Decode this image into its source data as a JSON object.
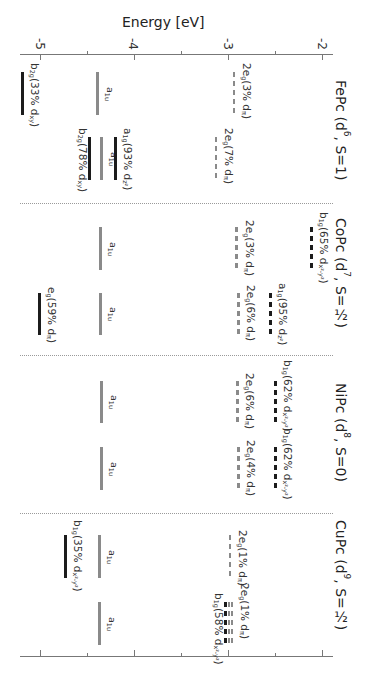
{
  "title": "Energy [eV]",
  "chart_data": {
    "type": "energy-level-diagram",
    "title": "Energy [eV]",
    "xlabel": "Energy [eV]",
    "ylabel": "",
    "orientation": "rotated 90° clockwise (energy increases to the right)",
    "axis": {
      "range": [
        -5.2,
        -1.9
      ],
      "major_ticks": [
        -5,
        -4,
        -3,
        -2
      ],
      "tick_labels": [
        "-5",
        "-4",
        "-3",
        "-2"
      ],
      "minor_ticks": [
        -4.5,
        -3.5,
        -2.5
      ]
    },
    "styles": {
      "black": "#1c1c1c",
      "gray": "#8a8a8a"
    },
    "compounds": [
      {
        "name": "FePc",
        "label": [
          {
            "t": "FePc (d"
          },
          {
            "t": "6",
            "sup": true
          },
          {
            "t": ", S=1)"
          }
        ],
        "label_y": 80,
        "columns": [
          {
            "y_range": [
              72,
              115
            ],
            "levels": [
              {
                "symmetry": "b2g",
                "d_character": "33% dxy",
                "energy": -5.19,
                "color": "black",
                "style": "solid",
                "side": "right",
                "label": [
                  {
                    "t": "b"
                  },
                  {
                    "t": "2g",
                    "sub": true
                  },
                  {
                    "t": "(33% d"
                  },
                  {
                    "t": "xy",
                    "sub": true
                  },
                  {
                    "t": ")"
                  }
                ]
              },
              {
                "symmetry": "a1u",
                "energy": -4.39,
                "color": "gray",
                "style": "solid",
                "side": "center",
                "label": [
                  {
                    "t": "a"
                  },
                  {
                    "t": "1u",
                    "sub": true
                  }
                ]
              },
              {
                "symmetry": "2eg",
                "d_character": "3% dπ",
                "energy": -2.94,
                "color": "gray",
                "style": "dashed",
                "side": "right",
                "label": [
                  {
                    "t": "2e"
                  },
                  {
                    "t": "g",
                    "sub": true
                  },
                  {
                    "t": "(3% d"
                  },
                  {
                    "t": "π",
                    "sub": true
                  },
                  {
                    "t": ")"
                  }
                ]
              }
            ]
          },
          {
            "y_range": [
              137,
              180
            ],
            "levels": [
              {
                "symmetry": "b2g",
                "d_character": "78% dxy",
                "energy": -4.48,
                "color": "black",
                "style": "solid",
                "side": "left",
                "label": [
                  {
                    "t": "b"
                  },
                  {
                    "t": "2g",
                    "sub": true
                  },
                  {
                    "t": "(78% d"
                  },
                  {
                    "t": "xy",
                    "sub": true
                  },
                  {
                    "t": ")"
                  }
                ]
              },
              {
                "symmetry": "a1u",
                "energy": -4.35,
                "color": "gray",
                "style": "solid",
                "side": "center",
                "label": [
                  {
                    "t": "a"
                  },
                  {
                    "t": "1u",
                    "sub": true
                  }
                ]
              },
              {
                "symmetry": "a1g",
                "d_character": "93% dz²",
                "energy": -4.2,
                "color": "black",
                "style": "solid",
                "side": "right",
                "label": [
                  {
                    "t": "a"
                  },
                  {
                    "t": "1g",
                    "sub": true
                  },
                  {
                    "t": "(93% d"
                  },
                  {
                    "t": "z²",
                    "sub": true
                  },
                  {
                    "t": ")"
                  }
                ]
              },
              {
                "symmetry": "2eg",
                "d_character": "7% dπ",
                "energy": -3.13,
                "color": "gray",
                "style": "dashed",
                "side": "right",
                "label": [
                  {
                    "t": "2e"
                  },
                  {
                    "t": "g",
                    "sub": true
                  },
                  {
                    "t": "(7% d"
                  },
                  {
                    "t": "π",
                    "sub": true
                  },
                  {
                    "t": ")"
                  }
                ]
              }
            ]
          }
        ]
      },
      {
        "name": "CoPc",
        "label": [
          {
            "t": "CoPc (d"
          },
          {
            "t": "7",
            "sup": true
          },
          {
            "t": ", S=½)"
          }
        ],
        "label_y": 218,
        "columns": [
          {
            "y_range": [
              227,
              270
            ],
            "levels": [
              {
                "symmetry": "a1u",
                "energy": -4.36,
                "color": "gray",
                "style": "solid",
                "side": "center",
                "label": [
                  {
                    "t": "a"
                  },
                  {
                    "t": "1u",
                    "sub": true
                  }
                ]
              },
              {
                "symmetry": "2eg",
                "d_character": "3% dπ",
                "energy": -2.91,
                "color": "gray",
                "style": "dashed",
                "side": "right",
                "dy": -7,
                "label": [
                  {
                    "t": "2e"
                  },
                  {
                    "t": "g",
                    "sub": true
                  },
                  {
                    "t": "(3% d"
                  },
                  {
                    "t": "π",
                    "sub": true
                  },
                  {
                    "t": ")"
                  }
                ]
              },
              {
                "symmetry": "b1g",
                "d_character": "65% dx²-y²",
                "energy": -2.12,
                "color": "black",
                "style": "dashed",
                "side": "right",
                "dy": -15,
                "label": [
                  {
                    "t": "b"
                  },
                  {
                    "t": "1g",
                    "sub": true
                  },
                  {
                    "t": "(65% d"
                  },
                  {
                    "t": "x²-y²",
                    "sub": true
                  },
                  {
                    "t": ")"
                  }
                ]
              }
            ]
          },
          {
            "y_range": [
              293,
              335
            ],
            "levels": [
              {
                "symmetry": "eg",
                "d_character": "59% dπ",
                "energy": -5.01,
                "color": "black",
                "style": "solid",
                "side": "right",
                "dy": -6,
                "label": [
                  {
                    "t": "e"
                  },
                  {
                    "t": "g",
                    "sub": true
                  },
                  {
                    "t": "(59% d"
                  },
                  {
                    "t": "π",
                    "sub": true
                  },
                  {
                    "t": ")"
                  }
                ]
              },
              {
                "symmetry": "a1u",
                "energy": -4.36,
                "color": "gray",
                "style": "solid",
                "side": "center",
                "label": [
                  {
                    "t": "a"
                  },
                  {
                    "t": "1u",
                    "sub": true
                  }
                ]
              },
              {
                "symmetry": "2eg",
                "d_character": "6% dπ",
                "energy": -2.89,
                "color": "gray",
                "style": "dashed",
                "side": "right",
                "dy": -8,
                "label": [
                  {
                    "t": "2e"
                  },
                  {
                    "t": "g",
                    "sub": true
                  },
                  {
                    "t": "(6% d"
                  },
                  {
                    "t": "π",
                    "sub": true
                  },
                  {
                    "t": ")"
                  }
                ]
              },
              {
                "symmetry": "a1g",
                "d_character": "95% dz²",
                "energy": -2.55,
                "color": "black",
                "style": "dashed",
                "side": "right",
                "dy": -10,
                "label": [
                  {
                    "t": "a"
                  },
                  {
                    "t": "1g",
                    "sub": true
                  },
                  {
                    "t": "(95% d"
                  },
                  {
                    "t": "z²",
                    "sub": true
                  },
                  {
                    "t": ")"
                  }
                ]
              }
            ]
          }
        ]
      },
      {
        "name": "NiPc",
        "label": [
          {
            "t": "NiPc (d"
          },
          {
            "t": "8",
            "sup": true
          },
          {
            "t": ", S=0)"
          }
        ],
        "label_y": 383,
        "columns": [
          {
            "y_range": [
              381,
              423
            ],
            "levels": [
              {
                "symmetry": "a1u",
                "energy": -4.35,
                "color": "gray",
                "style": "solid",
                "side": "center",
                "label": [
                  {
                    "t": "a"
                  },
                  {
                    "t": "1u",
                    "sub": true
                  }
                ]
              },
              {
                "symmetry": "2eg",
                "d_character": "6% dπ",
                "energy": -2.9,
                "color": "gray",
                "style": "dashed",
                "side": "right",
                "dy": -8,
                "label": [
                  {
                    "t": "2e"
                  },
                  {
                    "t": "g",
                    "sub": true
                  },
                  {
                    "t": "(6% d"
                  },
                  {
                    "t": "π",
                    "sub": true
                  },
                  {
                    "t": ")"
                  }
                ]
              },
              {
                "symmetry": "b1g",
                "d_character": "62% dx²-y²",
                "energy": -2.5,
                "color": "black",
                "style": "dashed",
                "side": "right",
                "dy": -21,
                "label": [
                  {
                    "t": "b"
                  },
                  {
                    "t": "1g",
                    "sub": true
                  },
                  {
                    "t": "(62% d"
                  },
                  {
                    "t": "x²-y²",
                    "sub": true
                  },
                  {
                    "t": ")"
                  }
                ]
              }
            ]
          },
          {
            "y_range": [
              447,
              490
            ],
            "levels": [
              {
                "symmetry": "a1u",
                "energy": -4.35,
                "color": "gray",
                "style": "solid",
                "side": "center",
                "label": [
                  {
                    "t": "a"
                  },
                  {
                    "t": "1u",
                    "sub": true
                  }
                ]
              },
              {
                "symmetry": "2eg",
                "d_character": "4% dπ",
                "energy": -2.89,
                "color": "gray",
                "style": "dashed",
                "side": "right",
                "dy": -7,
                "label": [
                  {
                    "t": "2e"
                  },
                  {
                    "t": "g",
                    "sub": true
                  },
                  {
                    "t": "(4% d"
                  },
                  {
                    "t": "π",
                    "sub": true
                  },
                  {
                    "t": ")"
                  }
                ]
              },
              {
                "symmetry": "b1g",
                "d_character": "62% dx²-y²",
                "energy": -2.5,
                "color": "black",
                "style": "dashed",
                "side": "right",
                "dy": -19,
                "label": [
                  {
                    "t": "b"
                  },
                  {
                    "t": "1g",
                    "sub": true
                  },
                  {
                    "t": "(62% d"
                  },
                  {
                    "t": "x²-y²",
                    "sub": true
                  },
                  {
                    "t": ")"
                  }
                ]
              }
            ]
          }
        ]
      },
      {
        "name": "CuPc",
        "label": [
          {
            "t": "CuPc (d"
          },
          {
            "t": "9",
            "sup": true
          },
          {
            "t": ", S=½)"
          }
        ],
        "label_y": 520,
        "columns": [
          {
            "y_range": [
              535,
              578
            ],
            "levels": [
              {
                "symmetry": "b1g",
                "d_character": "35% dx²-y²",
                "energy": -4.73,
                "color": "black",
                "style": "solid",
                "side": "right",
                "dy": -15,
                "label": [
                  {
                    "t": "b"
                  },
                  {
                    "t": "1g",
                    "sub": true
                  },
                  {
                    "t": "(35% d"
                  },
                  {
                    "t": "x²-y²",
                    "sub": true
                  },
                  {
                    "t": ")"
                  }
                ]
              },
              {
                "symmetry": "a1u",
                "energy": -4.37,
                "color": "gray",
                "style": "solid",
                "side": "center",
                "label": [
                  {
                    "t": "a"
                  },
                  {
                    "t": "1u",
                    "sub": true
                  }
                ]
              },
              {
                "symmetry": "2eg",
                "d_character": "1% dπ",
                "energy": -2.98,
                "color": "gray",
                "style": "dashed",
                "side": "right",
                "dy": -5,
                "label": [
                  {
                    "t": "2e"
                  },
                  {
                    "t": "g",
                    "sub": true
                  },
                  {
                    "t": "(1% d"
                  },
                  {
                    "t": "π",
                    "sub": true
                  },
                  {
                    "t": ")"
                  }
                ]
              }
            ]
          },
          {
            "y_range": [
              602,
              645
            ],
            "levels": [
              {
                "symmetry": "a1u",
                "energy": -4.37,
                "color": "gray",
                "style": "solid",
                "side": "center",
                "label": [
                  {
                    "t": "a"
                  },
                  {
                    "t": "1u",
                    "sub": true
                  }
                ]
              },
              {
                "symmetry": "b1g",
                "d_character": "58% dx²-y²",
                "energy": -3.03,
                "color": "black",
                "style": "dashed",
                "side": "left",
                "label": [
                  {
                    "t": "b"
                  },
                  {
                    "t": "1g",
                    "sub": true
                  },
                  {
                    "t": "(58% d"
                  },
                  {
                    "t": "x²-y²",
                    "sub": true
                  },
                  {
                    "t": ")"
                  }
                ]
              },
              {
                "symmetry": "2eg",
                "d_character": "1% dπ",
                "energy": -2.99,
                "color": "gray",
                "style": "dashed",
                "side": "none"
              },
              {
                "symmetry": "2eg",
                "d_character": "1% dπ",
                "energy": -2.96,
                "color": "gray",
                "style": "dashed",
                "side": "right",
                "dy": -19,
                "label": [
                  {
                    "t": "2e"
                  },
                  {
                    "t": "g",
                    "sub": true
                  },
                  {
                    "t": "(1% d"
                  },
                  {
                    "t": "π",
                    "sub": true
                  },
                  {
                    "t": ")"
                  }
                ]
              }
            ]
          }
        ]
      }
    ]
  }
}
